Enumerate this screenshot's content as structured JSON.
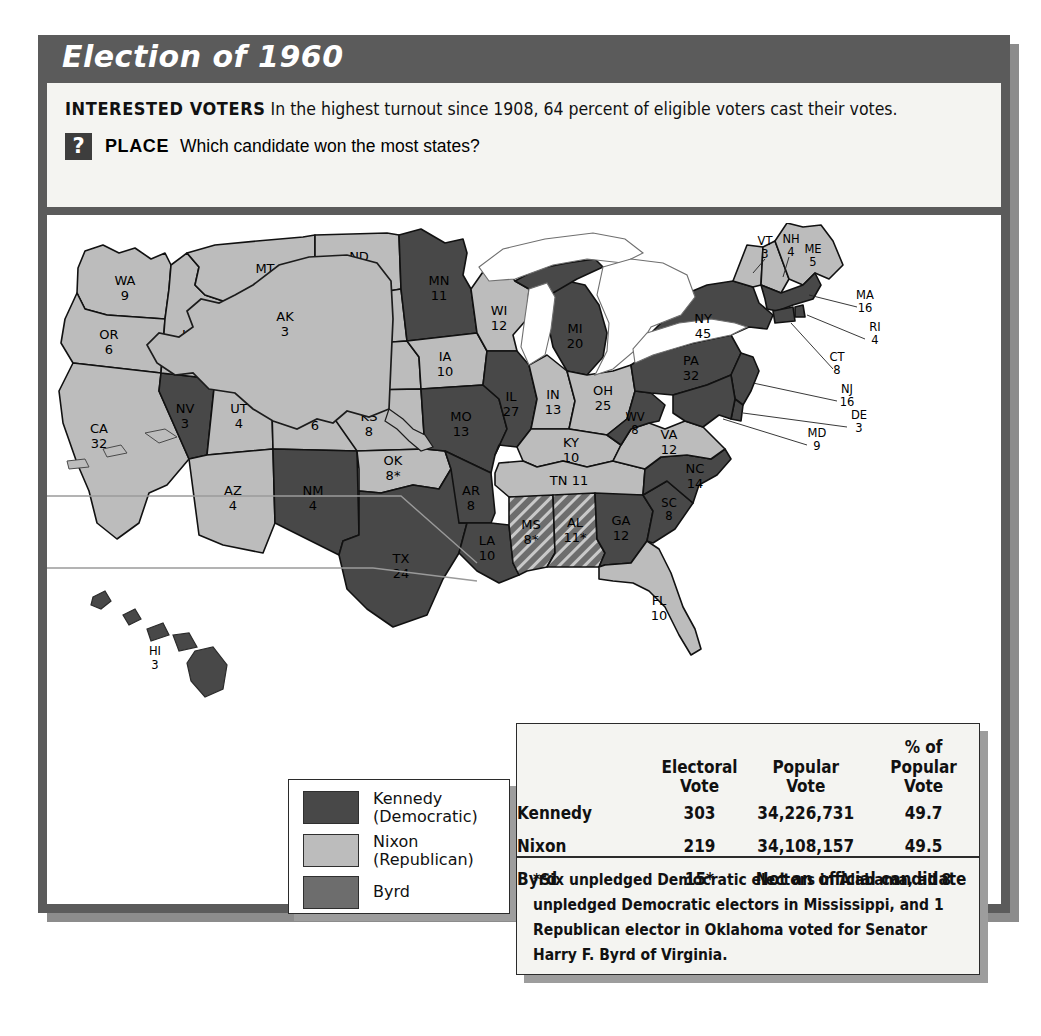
{
  "title": "Election of 1960",
  "caption": {
    "head": "INTERESTED VOTERS",
    "body": "In the highest turnout since 1908, 64 percent of eligible voters cast their votes.",
    "place_icon": "?",
    "place_label": "PLACE",
    "place_question": "Which candidate won the most states?"
  },
  "legend": {
    "items": [
      {
        "label": "Kennedy\n(Democratic)",
        "line1": "Kennedy",
        "line2": "(Democratic)",
        "color": "#484848"
      },
      {
        "label": "Nixon\n(Republican)",
        "line1": "Nixon",
        "line2": "(Republican)",
        "color": "#bcbcbc"
      },
      {
        "label": "Byrd",
        "line1": "Byrd",
        "line2": "",
        "color": "#6d6d6d"
      }
    ]
  },
  "table": {
    "headers": [
      {
        "line1": "",
        "line2": ""
      },
      {
        "line1": "Electoral",
        "line2": "Vote"
      },
      {
        "line1": "Popular",
        "line2": "Vote"
      },
      {
        "line1": "% of",
        "line2": "Popular Vote"
      }
    ],
    "rows": [
      {
        "candidate": "Kennedy",
        "electoral": "303",
        "popular": "34,226,731",
        "percent": "49.7"
      },
      {
        "candidate": "Nixon",
        "electoral": "219",
        "popular": "34,108,157",
        "percent": "49.5"
      },
      {
        "candidate": "Byrd",
        "electoral": "15*",
        "popular": "Not an official candidate",
        "percent": ""
      }
    ],
    "footnote": "*Six unpledged Democratic electors in Alabama, all 8 unpledged Democratic electors in Mississippi, and 1 Republican elector in Oklahoma voted for Senator Harry F. Byrd of Virginia."
  },
  "chart_data": {
    "type": "map",
    "title": "Election of 1960",
    "legend_position": "bottom-left",
    "categories": [
      "Kennedy (Democratic)",
      "Nixon (Republican)",
      "Byrd"
    ],
    "colors": {
      "kennedy": "#484848",
      "nixon": "#bcbcbc",
      "byrd": "#6d6d6d",
      "water": "#ffffff",
      "border": "#111111"
    },
    "totals": {
      "kennedy_electoral": 303,
      "nixon_electoral": 219,
      "byrd_electoral": 15,
      "kennedy_popular": 34226731,
      "nixon_popular": 34108157,
      "kennedy_percent": 49.7,
      "nixon_percent": 49.5
    },
    "states": [
      {
        "code": "WA",
        "votes": "9",
        "winner": "nixon"
      },
      {
        "code": "OR",
        "votes": "6",
        "winner": "nixon"
      },
      {
        "code": "CA",
        "votes": "32",
        "winner": "nixon"
      },
      {
        "code": "NV",
        "votes": "3",
        "winner": "kennedy"
      },
      {
        "code": "ID",
        "votes": "4",
        "winner": "nixon"
      },
      {
        "code": "MT",
        "votes": "4",
        "winner": "nixon"
      },
      {
        "code": "WY",
        "votes": "3",
        "winner": "nixon"
      },
      {
        "code": "UT",
        "votes": "4",
        "winner": "nixon"
      },
      {
        "code": "AZ",
        "votes": "4",
        "winner": "nixon"
      },
      {
        "code": "CO",
        "votes": "6",
        "winner": "nixon"
      },
      {
        "code": "NM",
        "votes": "4",
        "winner": "kennedy"
      },
      {
        "code": "ND",
        "votes": "4",
        "winner": "nixon"
      },
      {
        "code": "SD",
        "votes": "4",
        "winner": "nixon"
      },
      {
        "code": "NE",
        "votes": "6",
        "winner": "nixon"
      },
      {
        "code": "KS",
        "votes": "8",
        "winner": "nixon"
      },
      {
        "code": "OK",
        "votes": "8*",
        "winner": "nixon"
      },
      {
        "code": "TX",
        "votes": "24",
        "winner": "kennedy"
      },
      {
        "code": "MN",
        "votes": "11",
        "winner": "kennedy"
      },
      {
        "code": "IA",
        "votes": "10",
        "winner": "nixon"
      },
      {
        "code": "MO",
        "votes": "13",
        "winner": "kennedy"
      },
      {
        "code": "AR",
        "votes": "8",
        "winner": "kennedy"
      },
      {
        "code": "LA",
        "votes": "10",
        "winner": "kennedy"
      },
      {
        "code": "WI",
        "votes": "12",
        "winner": "nixon"
      },
      {
        "code": "IL",
        "votes": "27",
        "winner": "kennedy"
      },
      {
        "code": "MI",
        "votes": "20",
        "winner": "kennedy"
      },
      {
        "code": "IN",
        "votes": "13",
        "winner": "nixon"
      },
      {
        "code": "OH",
        "votes": "25",
        "winner": "nixon"
      },
      {
        "code": "KY",
        "votes": "10",
        "winner": "nixon"
      },
      {
        "code": "TN",
        "votes": "11",
        "winner": "nixon"
      },
      {
        "code": "MS",
        "votes": "8*",
        "winner": "byrd"
      },
      {
        "code": "AL",
        "votes": "11*",
        "winner": "byrd"
      },
      {
        "code": "GA",
        "votes": "12",
        "winner": "kennedy"
      },
      {
        "code": "FL",
        "votes": "10",
        "winner": "nixon"
      },
      {
        "code": "SC",
        "votes": "8",
        "winner": "kennedy"
      },
      {
        "code": "NC",
        "votes": "14",
        "winner": "kennedy"
      },
      {
        "code": "VA",
        "votes": "12",
        "winner": "nixon"
      },
      {
        "code": "WV",
        "votes": "8",
        "winner": "kennedy"
      },
      {
        "code": "PA",
        "votes": "32",
        "winner": "kennedy"
      },
      {
        "code": "NY",
        "votes": "45",
        "winner": "kennedy"
      },
      {
        "code": "VT",
        "votes": "3",
        "winner": "nixon"
      },
      {
        "code": "NH",
        "votes": "4",
        "winner": "nixon"
      },
      {
        "code": "ME",
        "votes": "5",
        "winner": "nixon"
      },
      {
        "code": "MA",
        "votes": "16",
        "winner": "kennedy"
      },
      {
        "code": "RI",
        "votes": "4",
        "winner": "kennedy"
      },
      {
        "code": "CT",
        "votes": "8",
        "winner": "kennedy"
      },
      {
        "code": "NJ",
        "votes": "16",
        "winner": "kennedy"
      },
      {
        "code": "DE",
        "votes": "3",
        "winner": "kennedy"
      },
      {
        "code": "MD",
        "votes": "9",
        "winner": "kennedy"
      },
      {
        "code": "AK",
        "votes": "3",
        "winner": "nixon"
      },
      {
        "code": "HI",
        "votes": "3",
        "winner": "kennedy"
      }
    ]
  }
}
